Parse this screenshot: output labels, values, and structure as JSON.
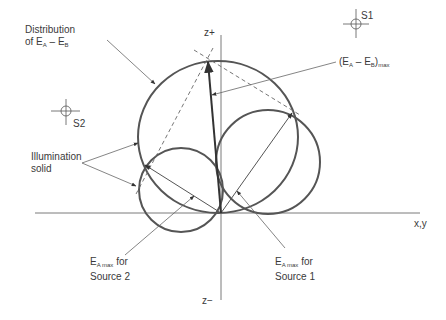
{
  "axes": {
    "horizontal_label": "x,y",
    "vertical_top_label": "z+",
    "vertical_bottom_label": "z−"
  },
  "sources": [
    {
      "id": "S1",
      "label": "S1"
    },
    {
      "id": "S2",
      "label": "S2"
    }
  ],
  "labels": {
    "distribution_line1": "Distribution",
    "distribution_line2_prefix": "of E",
    "distribution_sub_a": "A",
    "distribution_minus": " – E",
    "distribution_sub_b": "B",
    "max_prefix": "(E",
    "max_sub_a": "A",
    "max_minus": " – E",
    "max_sub_b": "B",
    "max_close": ")",
    "max_sub": "max",
    "illumination_line1": "Illumination",
    "illumination_line2": "solid",
    "source2_e": "E",
    "source2_sub": "A max",
    "source2_for": " for",
    "source2_line2": "Source 2",
    "source1_e": "E",
    "source1_sub": "A max",
    "source1_for": " for",
    "source1_line2": "Source 1"
  },
  "colors": {
    "curve": "#555555",
    "axis": "#7a7a7a",
    "leader": "#666666",
    "text": "#3a3a3a"
  }
}
